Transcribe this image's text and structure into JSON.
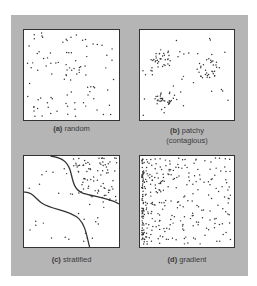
{
  "figure": {
    "background_color": "#b5b5b5",
    "panels": [
      {
        "id": "a",
        "letter": "(a)",
        "title": "random",
        "subtitle": ""
      },
      {
        "id": "b",
        "letter": "(b)",
        "title": "patchy",
        "subtitle": "(contagious)"
      },
      {
        "id": "c",
        "letter": "(c)",
        "title": "stratified",
        "subtitle": ""
      },
      {
        "id": "d",
        "letter": "(d)",
        "title": "gradient",
        "subtitle": ""
      }
    ]
  }
}
